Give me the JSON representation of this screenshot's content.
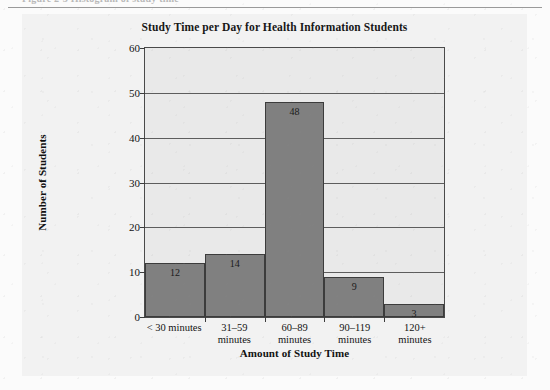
{
  "page": {
    "caption_remnant": "Figure 2-3  Histogram of study time"
  },
  "figure": {
    "title": "Study Time per Day for Health Information Students"
  },
  "chart_data": {
    "type": "bar",
    "title": "Study Time per Day for Health Information Students",
    "xlabel": "Amount of Study Time",
    "ylabel": "Number of Students",
    "categories": [
      "< 30 minutes",
      "31–59 minutes",
      "60–89 minutes",
      "90–119 minutes",
      "120+ minutes"
    ],
    "category_lines": [
      [
        "< 30 minutes",
        ""
      ],
      [
        "31–59",
        "minutes"
      ],
      [
        "60–89",
        "minutes"
      ],
      [
        "90–119",
        "minutes"
      ],
      [
        "120+",
        "minutes"
      ]
    ],
    "values": [
      12,
      14,
      48,
      9,
      3
    ],
    "ylim": [
      0,
      60
    ],
    "ytick_step": 10,
    "yticks": [
      0,
      10,
      20,
      30,
      40,
      50,
      60
    ],
    "grid": true,
    "legend": "none",
    "bar_gap": "none",
    "colors": {
      "bar_fill": "#808080",
      "bar_border": "#3c3c3c",
      "plot_background": "#e9e9e9",
      "figure_background": "#f2f2f2",
      "gridline": "#5d5d5d",
      "text": "#131313"
    }
  }
}
